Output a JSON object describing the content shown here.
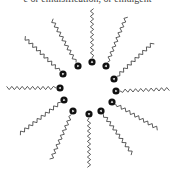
{
  "caption": "e or emulsification, or emulgent",
  "diagram": {
    "type": "micelle",
    "molecule_count": 12,
    "molecules": [
      {
        "id": 1,
        "orientation": "left"
      },
      {
        "id": 2,
        "orientation": "upper-left"
      },
      {
        "id": 3,
        "orientation": "upper-left"
      },
      {
        "id": 4,
        "orientation": "up"
      },
      {
        "id": 5,
        "orientation": "upper-right"
      },
      {
        "id": 6,
        "orientation": "upper-right"
      },
      {
        "id": 7,
        "orientation": "right"
      },
      {
        "id": 8,
        "orientation": "lower-right"
      },
      {
        "id": 9,
        "orientation": "lower-right"
      },
      {
        "id": 10,
        "orientation": "down"
      },
      {
        "id": 11,
        "orientation": "lower-left"
      },
      {
        "id": 12,
        "orientation": "lower-left"
      }
    ],
    "colors": {
      "head": "#111111",
      "head_mark": "#ffffff",
      "tail": "#333333"
    }
  }
}
